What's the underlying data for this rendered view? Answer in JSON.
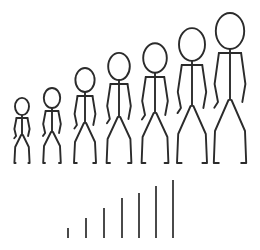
{
  "illustration": {
    "title": "Growth Stick Figures",
    "description": "Seven stick figures increasing in height left to right above seven ascending vertical bars",
    "background_color": "#ffffff",
    "stroke_color": "#2b2b2b",
    "bar_color": "#4a4a4a",
    "baseline_y": 163
  },
  "figures": {
    "count": 7,
    "stroke_width": 1.9,
    "items": [
      {
        "name": "stick-figure-1",
        "index": 1,
        "label": "Figure 1",
        "scale": 0.42,
        "center_x": 22,
        "top_y": 98,
        "height": 65,
        "head_rx": 7.0,
        "head_ry": 8.6,
        "head_cy": 106.5,
        "neck_y": 115.5,
        "hip_y": 135,
        "foot_y": 163,
        "shoulder_y": 118,
        "arm_out_x": 7.6,
        "arm_elbow_y": 129,
        "arm_hand_y": 136,
        "hip_half_w": 0.9,
        "knee_dx": 6.8,
        "knee_y": 147,
        "ankle_dx": 7.6,
        "foot_dx": 6.4
      },
      {
        "name": "stick-figure-2",
        "index": 2,
        "label": "Figure 2",
        "scale": 0.53,
        "center_x": 52,
        "top_y": 88,
        "height": 75,
        "head_rx": 8.2,
        "head_ry": 10.0,
        "head_cy": 98,
        "neck_y": 108,
        "hip_y": 132,
        "foot_y": 163,
        "shoulder_y": 111,
        "arm_out_x": 8.8,
        "arm_elbow_y": 124,
        "arm_hand_y": 133,
        "hip_half_w": 1.0,
        "knee_dx": 8.0,
        "knee_y": 146,
        "ankle_dx": 8.8,
        "foot_dx": 7.0
      },
      {
        "name": "stick-figure-3",
        "index": 3,
        "label": "Figure 3",
        "scale": 0.66,
        "center_x": 85,
        "top_y": 68,
        "height": 95,
        "head_rx": 9.6,
        "head_ry": 12.0,
        "head_cy": 80,
        "neck_y": 92,
        "hip_y": 123,
        "foot_y": 163,
        "shoulder_y": 96,
        "arm_out_x": 10.4,
        "arm_elbow_y": 114,
        "arm_hand_y": 125,
        "hip_half_w": 1.1,
        "knee_dx": 10.0,
        "knee_y": 142,
        "ankle_dx": 11.0,
        "foot_dx": 8.2
      },
      {
        "name": "stick-figure-4",
        "index": 4,
        "label": "Figure 4",
        "scale": 0.76,
        "center_x": 119,
        "top_y": 53,
        "height": 110,
        "head_rx": 10.8,
        "head_ry": 13.6,
        "head_cy": 66.5,
        "neck_y": 80,
        "hip_y": 117,
        "foot_y": 163,
        "shoulder_y": 84,
        "arm_out_x": 11.8,
        "arm_elbow_y": 106,
        "arm_hand_y": 119,
        "hip_half_w": 1.2,
        "knee_dx": 11.4,
        "knee_y": 139,
        "ankle_dx": 12.4,
        "foot_dx": 9.0
      },
      {
        "name": "stick-figure-5",
        "index": 5,
        "label": "Figure 5",
        "scale": 0.84,
        "center_x": 155,
        "top_y": 43,
        "height": 120,
        "head_rx": 11.8,
        "head_ry": 14.8,
        "head_cy": 58,
        "neck_y": 73,
        "hip_y": 113,
        "foot_y": 163,
        "shoulder_y": 77,
        "arm_out_x": 12.8,
        "arm_elbow_y": 101,
        "arm_hand_y": 115,
        "hip_half_w": 1.3,
        "knee_dx": 12.4,
        "knee_y": 137,
        "ankle_dx": 13.4,
        "foot_dx": 9.6
      },
      {
        "name": "stick-figure-6",
        "index": 6,
        "label": "Figure 6",
        "scale": 0.93,
        "center_x": 192,
        "top_y": 28,
        "height": 135,
        "head_rx": 13.0,
        "head_ry": 16.4,
        "head_cy": 44.5,
        "neck_y": 61,
        "hip_y": 106,
        "foot_y": 163,
        "shoulder_y": 65,
        "arm_out_x": 14.2,
        "arm_elbow_y": 92,
        "arm_hand_y": 108,
        "hip_half_w": 1.4,
        "knee_dx": 13.8,
        "knee_y": 134,
        "ankle_dx": 15.0,
        "foot_dx": 10.4
      },
      {
        "name": "stick-figure-7",
        "index": 7,
        "label": "Figure 7",
        "scale": 1.0,
        "center_x": 230,
        "top_y": 13,
        "height": 150,
        "head_rx": 14.2,
        "head_ry": 18.0,
        "head_cy": 31,
        "neck_y": 49,
        "hip_y": 100,
        "foot_y": 163,
        "shoulder_y": 53,
        "arm_out_x": 15.4,
        "arm_elbow_y": 84,
        "arm_hand_y": 102,
        "hip_half_w": 1.5,
        "knee_dx": 15.0,
        "knee_y": 131,
        "ankle_dx": 16.2,
        "foot_dx": 11.2
      }
    ]
  },
  "chart_data": {
    "type": "bar",
    "title": "",
    "subtitle": "",
    "xlabel": "",
    "ylabel": "",
    "grid": false,
    "legend_position": "none",
    "categories": [
      "1",
      "2",
      "3",
      "4",
      "5",
      "6",
      "7"
    ],
    "values": [
      10,
      20,
      30,
      40,
      45,
      52,
      58
    ],
    "ylim": [
      0,
      60
    ],
    "baseline_y": 238,
    "bar_width": 2,
    "bar_color": "#4a4a4a",
    "bars": [
      {
        "name": "bar-1",
        "index": 1,
        "x": 68,
        "top_y": 228,
        "bottom_y": 238,
        "height": 10,
        "value": 10
      },
      {
        "name": "bar-2",
        "index": 2,
        "x": 86,
        "top_y": 218,
        "bottom_y": 238,
        "height": 20,
        "value": 20
      },
      {
        "name": "bar-3",
        "index": 3,
        "x": 104,
        "top_y": 208,
        "bottom_y": 238,
        "height": 30,
        "value": 30
      },
      {
        "name": "bar-4",
        "index": 4,
        "x": 122,
        "top_y": 198,
        "bottom_y": 238,
        "height": 40,
        "value": 40
      },
      {
        "name": "bar-5",
        "index": 5,
        "x": 139,
        "top_y": 193,
        "bottom_y": 238,
        "height": 45,
        "value": 45
      },
      {
        "name": "bar-6",
        "index": 6,
        "x": 156,
        "top_y": 186,
        "bottom_y": 238,
        "height": 52,
        "value": 52
      },
      {
        "name": "bar-7",
        "index": 7,
        "x": 173,
        "top_y": 180,
        "bottom_y": 238,
        "height": 58,
        "value": 58
      }
    ]
  }
}
